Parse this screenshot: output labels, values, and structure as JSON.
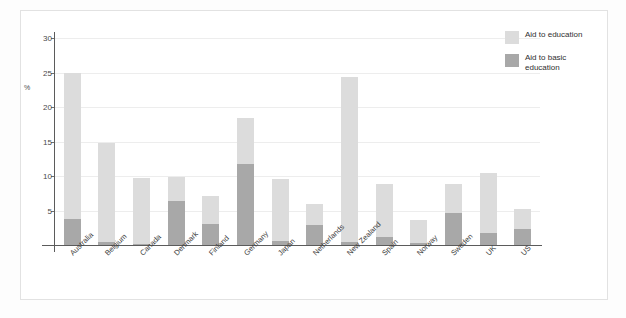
{
  "chart_data": {
    "type": "bar",
    "stacked": true,
    "title": "",
    "xlabel": "",
    "ylabel": "%",
    "ylim": [
      0,
      30
    ],
    "yticks": [
      0,
      5,
      10,
      15,
      20,
      25,
      30
    ],
    "ytick_labels": [
      "",
      "5",
      "10",
      "15",
      "20",
      "25",
      "30"
    ],
    "grid": true,
    "legend_position": "top-right",
    "categories": [
      "Australia",
      "Belgium",
      "Canada",
      "Denmark",
      "Finland",
      "Germany",
      "Japan",
      "Netherlands",
      "New Zealand",
      "Spain",
      "Norway",
      "Sweden",
      "UK",
      "US"
    ],
    "series": [
      {
        "name": "Aid to basic education",
        "color": "#a8a8a8",
        "values": [
          3.7,
          0.5,
          0.2,
          6.4,
          3.0,
          11.7,
          0.6,
          2.9,
          0.4,
          1.2,
          0.3,
          4.6,
          1.8,
          2.3
        ]
      },
      {
        "name": "Aid to education",
        "color": "#dcdcdc",
        "values": [
          24.9,
          14.8,
          9.7,
          9.8,
          7.1,
          18.4,
          9.6,
          5.9,
          24.4,
          8.8,
          3.6,
          8.9,
          10.5,
          5.2
        ]
      }
    ],
    "legend": [
      {
        "label": "Aid to education",
        "color": "#dcdcdc"
      },
      {
        "label": "Aid to basic education",
        "color": "#a8a8a8"
      }
    ]
  }
}
